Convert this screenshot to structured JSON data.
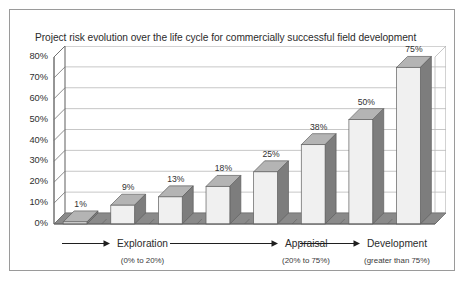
{
  "chart_data": {
    "type": "bar",
    "title": "Project risk evolution over the life cycle for commercially successful field development",
    "xlabel": "",
    "ylabel": "",
    "ylim": [
      0,
      80
    ],
    "grid": true,
    "legend": "none",
    "style": "3d-column",
    "categories": [
      "1",
      "2",
      "3",
      "4",
      "5",
      "6",
      "7",
      "8"
    ],
    "values": [
      1,
      9,
      13,
      18,
      25,
      38,
      50,
      75
    ],
    "data_labels": [
      "1%",
      "9%",
      "13%",
      "18%",
      "25%",
      "38%",
      "50%",
      "75%"
    ],
    "yticks": [
      0,
      10,
      20,
      30,
      40,
      50,
      60,
      70,
      80
    ],
    "ytick_labels": [
      "0%",
      "10%",
      "20%",
      "30%",
      "40%",
      "50%",
      "60%",
      "70%",
      "80%"
    ],
    "annotations": [
      {
        "name": "Exploration",
        "range": "(0% to 20%)"
      },
      {
        "name": "Appraisal",
        "range": "(20% to 75%)"
      },
      {
        "name": "Development",
        "range": "(greater than 75%)"
      }
    ]
  },
  "colors": {
    "bar_front": "#f0f0f0",
    "bar_side": "#7d7d7d",
    "bar_top": "#b4b4b4",
    "floor": "#8a8a8a",
    "gridline": "#b9b9b9",
    "axis": "#6e6e6e",
    "frame_border": "#9a9a9a",
    "text": "#2b2b2b",
    "background": "#ffffff"
  }
}
